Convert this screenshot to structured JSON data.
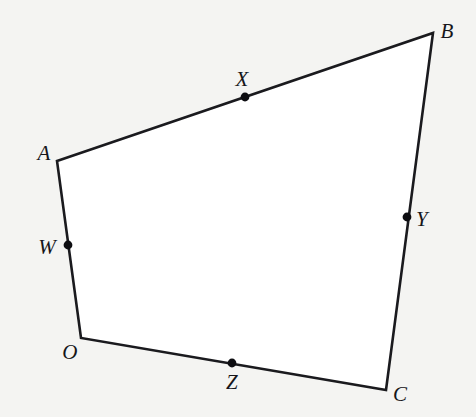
{
  "figure": {
    "background_color": "#f4f4f2",
    "fill_color": "#ffffff",
    "stroke_color": "#1a1a1e",
    "dot_color": "#0d0d11",
    "stroke_width": 2.6,
    "dot_radius": 4.4,
    "canvas": {
      "width": 476,
      "height": 417
    }
  },
  "vertices": [
    {
      "id": "A",
      "label": "A",
      "x": 57,
      "y": 161,
      "label_x": 44,
      "label_y": 153
    },
    {
      "id": "B",
      "label": "B",
      "x": 433,
      "y": 33,
      "label_x": 447,
      "label_y": 31
    },
    {
      "id": "C",
      "label": "C",
      "x": 386,
      "y": 390,
      "label_x": 400,
      "label_y": 394
    },
    {
      "id": "O",
      "label": "O",
      "x": 81,
      "y": 338,
      "label_x": 70,
      "label_y": 352
    }
  ],
  "points": [
    {
      "id": "W",
      "label": "W",
      "x": 68,
      "y": 245,
      "label_x": 47,
      "label_y": 247,
      "on_edge": "A-O"
    },
    {
      "id": "X",
      "label": "X",
      "x": 245,
      "y": 97,
      "label_x": 242,
      "label_y": 79,
      "on_edge": "A-B"
    },
    {
      "id": "Y",
      "label": "Y",
      "x": 407,
      "y": 217,
      "label_x": 422,
      "label_y": 219,
      "on_edge": "B-C"
    },
    {
      "id": "Z",
      "label": "Z",
      "x": 232,
      "y": 363,
      "label_x": 232,
      "label_y": 382,
      "on_edge": "O-C"
    }
  ],
  "edges": [
    {
      "id": "A-B",
      "from": "A",
      "to": "B"
    },
    {
      "id": "B-C",
      "from": "B",
      "to": "C"
    },
    {
      "id": "C-O",
      "from": "C",
      "to": "O"
    },
    {
      "id": "O-A",
      "from": "O",
      "to": "A"
    }
  ],
  "polygon_order": [
    "A",
    "B",
    "C",
    "O"
  ]
}
